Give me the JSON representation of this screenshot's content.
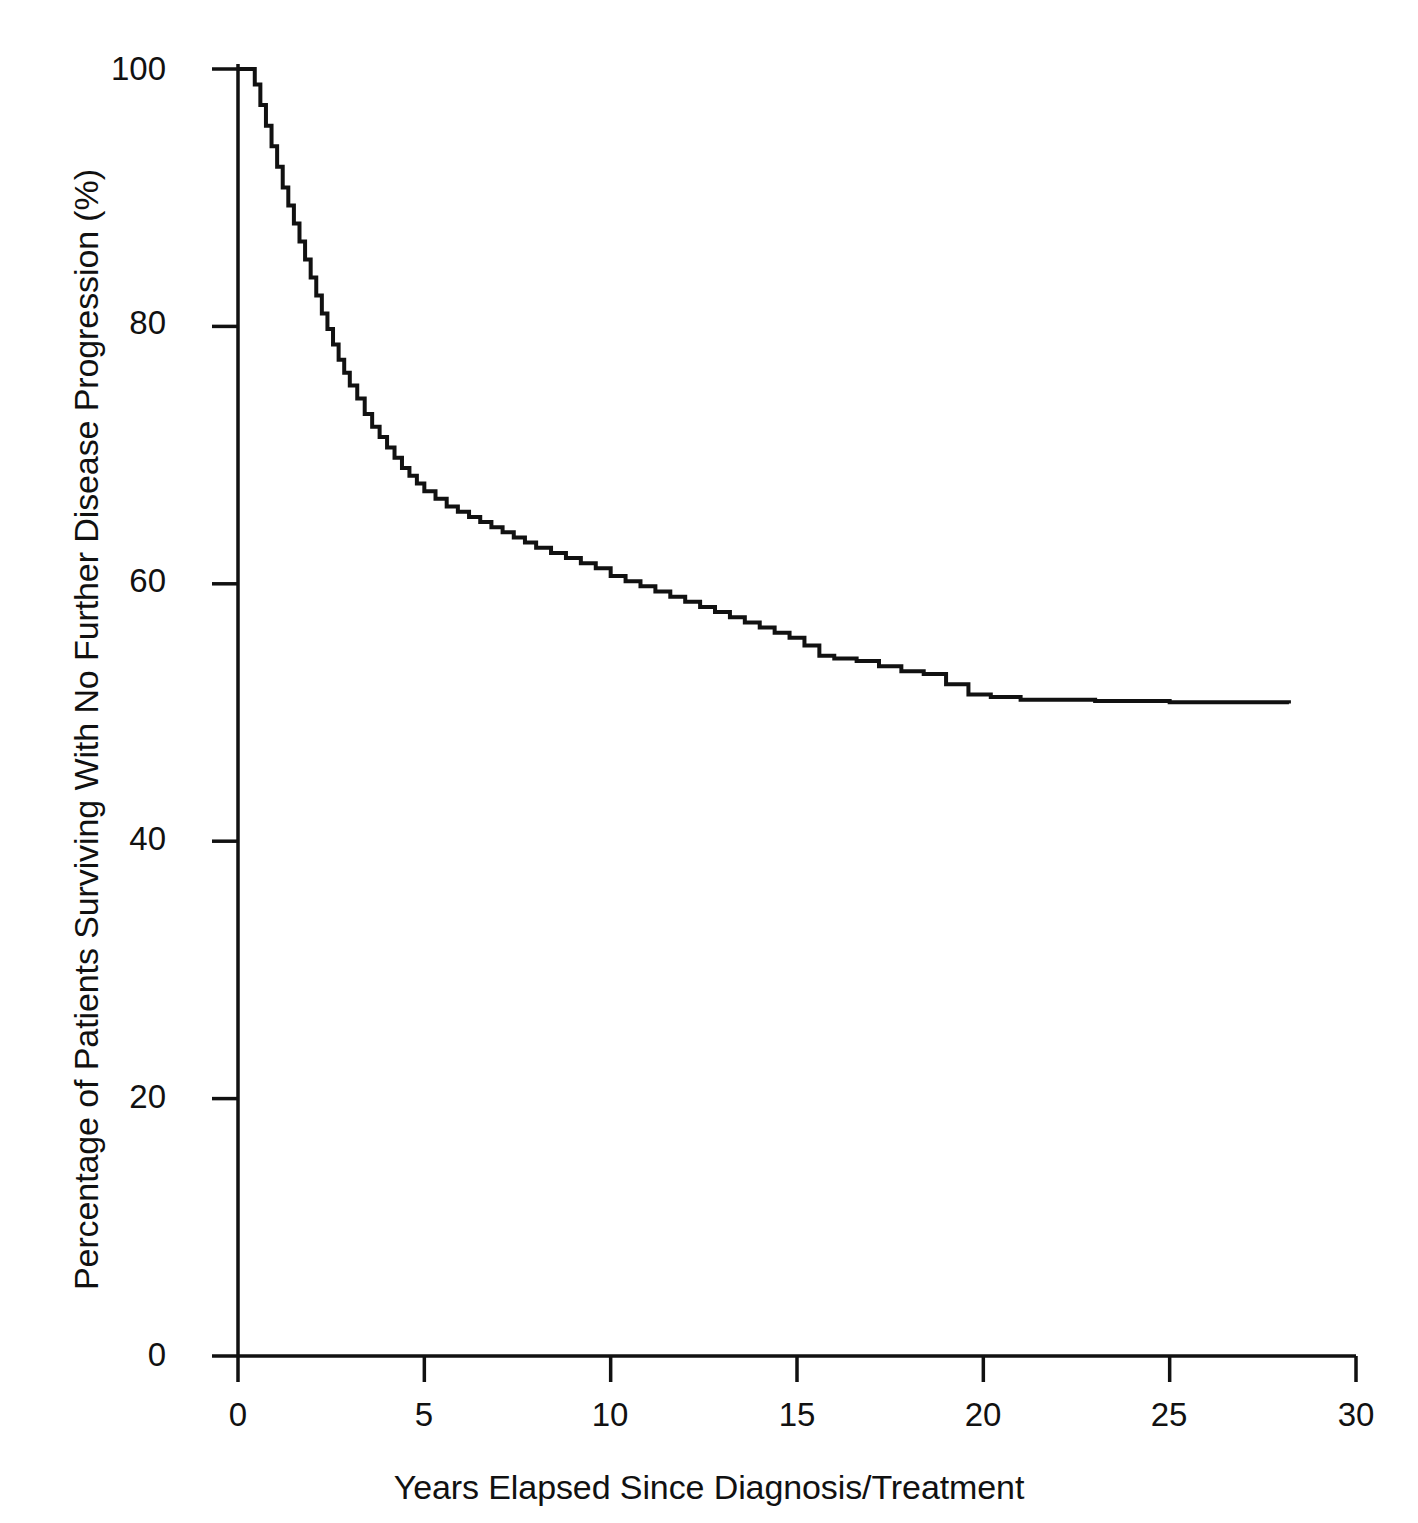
{
  "figure": {
    "background_color": "#ffffff",
    "line_color": "#111111",
    "axis_color": "#111111"
  },
  "axes": {
    "x_title": "Years Elapsed Since Diagnosis/Treatment",
    "y_title": "Percentage of Patients Surviving With No Further Disease Progression (%)",
    "x_ticks": [
      "0",
      "5",
      "10",
      "15",
      "20",
      "25",
      "30"
    ],
    "y_ticks": [
      "0",
      "20",
      "40",
      "60",
      "80",
      "100"
    ]
  },
  "chart_data": {
    "type": "line",
    "title": "",
    "subtitle": "",
    "xlabel": "Years Elapsed Since Diagnosis/Treatment",
    "ylabel": "Percentage of Patients Surviving With No Further Disease Progression (%)",
    "xlim": [
      0,
      30
    ],
    "ylim": [
      0,
      100
    ],
    "xticks": [
      0,
      5,
      10,
      15,
      20,
      25,
      30
    ],
    "yticks": [
      0,
      20,
      40,
      60,
      80,
      100
    ],
    "grid": false,
    "legend": null,
    "annotations": [],
    "step_curve": true,
    "series": [
      {
        "name": "Progression-free survival",
        "x": [
          0.0,
          0.3,
          0.45,
          0.6,
          0.75,
          0.9,
          1.05,
          1.2,
          1.35,
          1.5,
          1.65,
          1.8,
          1.95,
          2.1,
          2.25,
          2.4,
          2.55,
          2.7,
          2.85,
          3.0,
          3.2,
          3.4,
          3.6,
          3.8,
          4.0,
          4.2,
          4.4,
          4.6,
          4.8,
          5.0,
          5.3,
          5.6,
          5.9,
          6.2,
          6.5,
          6.8,
          7.1,
          7.4,
          7.7,
          8.0,
          8.4,
          8.8,
          9.2,
          9.6,
          10.0,
          10.4,
          10.8,
          11.2,
          11.6,
          12.0,
          12.4,
          12.8,
          13.2,
          13.6,
          14.0,
          14.4,
          14.8,
          15.2,
          15.6,
          16.0,
          16.6,
          17.2,
          17.8,
          18.4,
          19.0,
          19.6,
          20.2,
          21.0,
          23.0,
          25.0,
          28.2
        ],
        "y": [
          100.0,
          100.0,
          98.8,
          97.2,
          95.6,
          94.0,
          92.4,
          90.8,
          89.4,
          88.0,
          86.6,
          85.2,
          83.8,
          82.4,
          81.0,
          79.8,
          78.6,
          77.4,
          76.4,
          75.4,
          74.4,
          73.2,
          72.2,
          71.4,
          70.6,
          69.8,
          69.0,
          68.4,
          67.8,
          67.2,
          66.6,
          66.0,
          65.6,
          65.2,
          64.8,
          64.4,
          64.0,
          63.6,
          63.2,
          62.8,
          62.4,
          62.0,
          61.6,
          61.2,
          60.6,
          60.2,
          59.8,
          59.4,
          59.0,
          58.6,
          58.2,
          57.8,
          57.4,
          57.0,
          56.6,
          56.2,
          55.8,
          55.2,
          54.4,
          54.2,
          54.0,
          53.6,
          53.2,
          53.0,
          52.2,
          51.4,
          51.2,
          51.0,
          50.9,
          50.8,
          50.7
        ]
      }
    ]
  }
}
